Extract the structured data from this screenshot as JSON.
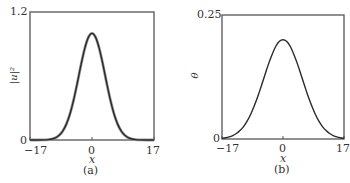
{
  "chart_data": [
    {
      "type": "line",
      "panel": "(a)",
      "title": "",
      "xlabel": "x",
      "ylabel": "|u|²",
      "xlim": [
        -17,
        17
      ],
      "ylim": [
        0,
        1.2
      ],
      "xticks": [
        "-17",
        "0",
        "17"
      ],
      "yticks": [
        "0",
        "1.2"
      ],
      "grid": false,
      "legend": null,
      "x": [
        -17,
        -16,
        -15,
        -14,
        -13,
        -12,
        -11,
        -10,
        -9,
        -8,
        -7,
        -6,
        -5,
        -4,
        -3,
        -2,
        -1,
        0,
        1,
        2,
        3,
        4,
        5,
        6,
        7,
        8,
        9,
        10,
        11,
        12,
        13,
        14,
        15,
        16,
        17
      ],
      "series": [
        {
          "name": "curve-gray",
          "color": "#9a9a9a",
          "values": [
            0,
            0,
            0,
            0.0005,
            0.0015,
            0.0039,
            0.0094,
            0.021,
            0.044,
            0.085,
            0.151,
            0.249,
            0.381,
            0.539,
            0.707,
            0.857,
            0.962,
            1.0,
            0.962,
            0.857,
            0.707,
            0.539,
            0.381,
            0.249,
            0.151,
            0.085,
            0.044,
            0.021,
            0.0094,
            0.0039,
            0.0015,
            0.0005,
            0,
            0,
            0
          ]
        },
        {
          "name": "curve-dark",
          "color": "#2a2a2a",
          "values": [
            0,
            0,
            0,
            0.0005,
            0.0015,
            0.0039,
            0.0094,
            0.021,
            0.044,
            0.085,
            0.151,
            0.249,
            0.381,
            0.539,
            0.707,
            0.857,
            0.962,
            1.0,
            0.962,
            0.857,
            0.707,
            0.539,
            0.381,
            0.249,
            0.151,
            0.085,
            0.044,
            0.021,
            0.0094,
            0.0039,
            0.0015,
            0.0005,
            0,
            0,
            0
          ]
        }
      ]
    },
    {
      "type": "line",
      "panel": "(b)",
      "title": "",
      "xlabel": "x",
      "ylabel": "θ",
      "xlim": [
        -17,
        17
      ],
      "ylim": [
        0,
        0.25
      ],
      "xticks": [
        "-17",
        "0",
        "17"
      ],
      "yticks": [
        "0",
        "0.25"
      ],
      "grid": false,
      "legend": null,
      "x": [
        -17,
        -16,
        -15,
        -14,
        -13,
        -12,
        -11,
        -10,
        -9,
        -8,
        -7,
        -6,
        -5,
        -4,
        -3,
        -2,
        -1,
        0,
        1,
        2,
        3,
        4,
        5,
        6,
        7,
        8,
        9,
        10,
        11,
        12,
        13,
        14,
        15,
        16,
        17
      ],
      "series": [
        {
          "name": "theta",
          "color": "#2a2a2a",
          "values": [
            0.0014,
            0.0025,
            0.0042,
            0.0069,
            0.011,
            0.017,
            0.025,
            0.036,
            0.05,
            0.067,
            0.086,
            0.108,
            0.13,
            0.152,
            0.171,
            0.187,
            0.197,
            0.2,
            0.197,
            0.187,
            0.171,
            0.152,
            0.13,
            0.108,
            0.086,
            0.067,
            0.05,
            0.036,
            0.025,
            0.017,
            0.011,
            0.0069,
            0.0042,
            0.0025,
            0.0014
          ]
        }
      ]
    }
  ],
  "panels": {
    "a": {
      "caption": "(a)",
      "xlabel": "x",
      "ylabel": "|u|²",
      "ytick_top": "1.2",
      "ytick_bottom": "0",
      "xtick_left": "−17",
      "xtick_mid": "0",
      "xtick_right": "17"
    },
    "b": {
      "caption": "(b)",
      "xlabel": "x",
      "ylabel": "θ",
      "ytick_top": "0.25",
      "ytick_bottom": "0",
      "xtick_left": "−17",
      "xtick_mid": "0",
      "xtick_right": "17"
    }
  }
}
